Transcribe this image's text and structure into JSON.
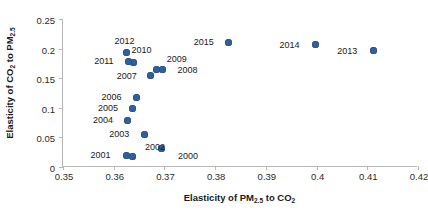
{
  "chart_data": {
    "type": "scatter",
    "title": "",
    "xlabel": "Elasticity of PM2.5 to CO2",
    "ylabel": "Elasticity of CO2 to PM2.5",
    "xlim": [
      0.35,
      0.42
    ],
    "ylim": [
      0,
      0.25
    ],
    "grid": false,
    "legend": "none",
    "marker_color": "#2e5f9e",
    "xticks": [
      "0.35",
      "0.36",
      "0.37",
      "0.38",
      "0.39",
      "0.4",
      "0.41",
      "0.42"
    ],
    "xtick_values": [
      0.35,
      0.36,
      0.37,
      0.38,
      0.39,
      0.4,
      0.41,
      0.42
    ],
    "yticks": [
      "0",
      "0.05",
      "0.1",
      "0.15",
      "0.2",
      "0.25"
    ],
    "ytick_values": [
      0,
      0.05,
      0.1,
      0.15,
      0.2,
      0.25
    ],
    "point_labels": [
      "2000",
      "2001",
      "2002",
      "2003",
      "2004",
      "2005",
      "2006",
      "2007",
      "2008",
      "2009",
      "2010",
      "2011",
      "2012",
      "2013",
      "2014",
      "2015"
    ],
    "x": [
      0.3695,
      0.3625,
      0.3638,
      0.366,
      0.3628,
      0.3638,
      0.3645,
      0.3673,
      0.3696,
      0.3685,
      0.3639,
      0.363,
      0.3625,
      0.4112,
      0.3998,
      0.3827
    ],
    "y": [
      0.032,
      0.02,
      0.0185,
      0.0555,
      0.079,
      0.0995,
      0.118,
      0.154,
      0.164,
      0.164,
      0.176,
      0.179,
      0.1935,
      0.196,
      0.2065,
      0.2105
    ],
    "points": [
      {
        "label": "2000",
        "x": 0.3695,
        "y": 0.032,
        "label_dx": 26,
        "label_dy": 8
      },
      {
        "label": "2001",
        "x": 0.3625,
        "y": 0.02,
        "label_dx": -26,
        "label_dy": 0
      },
      {
        "label": "2002",
        "x": 0.3638,
        "y": 0.0185,
        "label_dx": 22,
        "label_dy": -9
      },
      {
        "label": "2003",
        "x": 0.366,
        "y": 0.0555,
        "label_dx": -25,
        "label_dy": 0
      },
      {
        "label": "2004",
        "x": 0.3628,
        "y": 0.079,
        "label_dx": -25,
        "label_dy": 0
      },
      {
        "label": "2005",
        "x": 0.3638,
        "y": 0.0995,
        "label_dx": -25,
        "label_dy": 0
      },
      {
        "label": "2006",
        "x": 0.3645,
        "y": 0.118,
        "label_dx": -25,
        "label_dy": 0
      },
      {
        "label": "2007",
        "x": 0.3673,
        "y": 0.154,
        "label_dx": -24,
        "label_dy": 0
      },
      {
        "label": "2008",
        "x": 0.3696,
        "y": 0.164,
        "label_dx": 25,
        "label_dy": 0
      },
      {
        "label": "2009",
        "x": 0.3685,
        "y": 0.164,
        "label_dx": 20,
        "label_dy": -11
      },
      {
        "label": "2010",
        "x": 0.3639,
        "y": 0.176,
        "label_dx": 8,
        "label_dy": -13
      },
      {
        "label": "2011",
        "x": 0.363,
        "y": 0.179,
        "label_dx": -25,
        "label_dy": 0
      },
      {
        "label": "2012",
        "x": 0.3625,
        "y": 0.1935,
        "label_dx": -2,
        "label_dy": -11
      },
      {
        "label": "2013",
        "x": 0.4112,
        "y": 0.196,
        "label_dx": -26,
        "label_dy": 0
      },
      {
        "label": "2014",
        "x": 0.3998,
        "y": 0.2065,
        "label_dx": -26,
        "label_dy": 0
      },
      {
        "label": "2015",
        "x": 0.3827,
        "y": 0.2105,
        "label_dx": -25,
        "label_dy": 0
      }
    ]
  },
  "axis_titles": {
    "x_prefix": "Elasticity of PM",
    "x_sub1": "2.5",
    "x_mid": " to CO",
    "x_sub2": "2",
    "y_prefix": "Elasticity of CO",
    "y_sub1": "2",
    "y_mid": " to PM",
    "y_sub2": "2.5"
  }
}
